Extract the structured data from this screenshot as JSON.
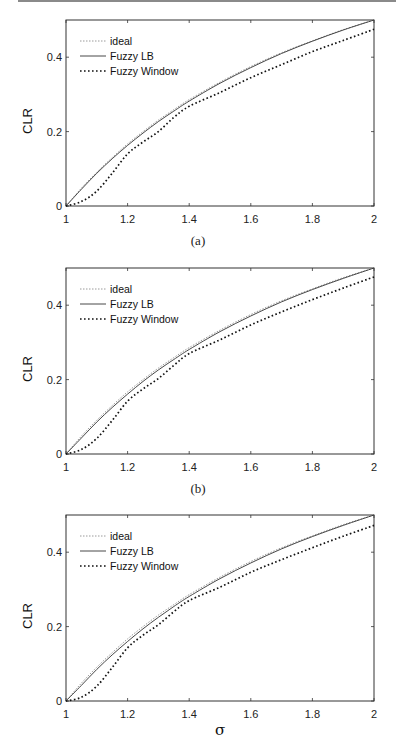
{
  "chart_data": [
    {
      "type": "line",
      "panel": "a",
      "caption": "(a)",
      "title": "",
      "xlabel": "σ",
      "ylabel": "CLR",
      "xlim": [
        1,
        2
      ],
      "ylim": [
        0,
        0.5
      ],
      "xticks": [
        "1",
        "1.2",
        "1.4",
        "1.6",
        "1.8",
        "2"
      ],
      "yticks": [
        "0",
        "0.2",
        "0.4"
      ],
      "grid": false,
      "legend_position": "upper left",
      "x": [
        1.0,
        1.05,
        1.1,
        1.15,
        1.2,
        1.25,
        1.3,
        1.35,
        1.4,
        1.5,
        1.6,
        1.7,
        1.8,
        1.9,
        2.0
      ],
      "series": [
        {
          "name": "ideal",
          "style": "dotted-thin",
          "values": [
            0.0,
            0.048,
            0.091,
            0.13,
            0.167,
            0.2,
            0.231,
            0.259,
            0.286,
            0.333,
            0.375,
            0.412,
            0.444,
            0.474,
            0.5
          ]
        },
        {
          "name": "Fuzzy LB",
          "style": "solid",
          "values": [
            0.0,
            0.045,
            0.088,
            0.127,
            0.163,
            0.196,
            0.227,
            0.255,
            0.282,
            0.33,
            0.372,
            0.41,
            0.443,
            0.473,
            0.5
          ]
        },
        {
          "name": "Fuzzy Window",
          "style": "dotted-thick",
          "values": [
            0.0,
            0.012,
            0.04,
            0.088,
            0.14,
            0.172,
            0.2,
            0.238,
            0.268,
            0.305,
            0.345,
            0.38,
            0.415,
            0.445,
            0.475
          ]
        }
      ]
    },
    {
      "type": "line",
      "panel": "b",
      "caption": "(b)",
      "title": "",
      "xlabel": "σ",
      "ylabel": "CLR",
      "xlim": [
        1,
        2
      ],
      "ylim": [
        0,
        0.5
      ],
      "xticks": [
        "1",
        "1.2",
        "1.4",
        "1.6",
        "1.8",
        "2"
      ],
      "yticks": [
        "0",
        "0.2",
        "0.4"
      ],
      "grid": false,
      "legend_position": "upper left",
      "x": [
        1.0,
        1.05,
        1.1,
        1.15,
        1.2,
        1.25,
        1.3,
        1.35,
        1.4,
        1.5,
        1.6,
        1.7,
        1.8,
        1.9,
        2.0
      ],
      "series": [
        {
          "name": "ideal",
          "style": "dotted-thin",
          "values": [
            0.0,
            0.048,
            0.091,
            0.13,
            0.167,
            0.2,
            0.231,
            0.259,
            0.286,
            0.333,
            0.375,
            0.412,
            0.444,
            0.474,
            0.5
          ]
        },
        {
          "name": "Fuzzy LB",
          "style": "solid",
          "values": [
            0.0,
            0.043,
            0.086,
            0.125,
            0.161,
            0.195,
            0.226,
            0.254,
            0.281,
            0.329,
            0.371,
            0.409,
            0.442,
            0.472,
            0.5
          ]
        },
        {
          "name": "Fuzzy Window",
          "style": "dotted-thick",
          "values": [
            0.0,
            0.012,
            0.042,
            0.09,
            0.142,
            0.175,
            0.203,
            0.238,
            0.27,
            0.307,
            0.347,
            0.382,
            0.415,
            0.446,
            0.476
          ]
        }
      ]
    },
    {
      "type": "line",
      "panel": "c",
      "caption": "",
      "title": "",
      "xlabel": "σ",
      "ylabel": "CLR",
      "xlim": [
        1,
        2
      ],
      "ylim": [
        0,
        0.5
      ],
      "xticks": [
        "1",
        "1.2",
        "1.4",
        "1.6",
        "1.8",
        "2"
      ],
      "yticks": [
        "0",
        "0.2",
        "0.4"
      ],
      "grid": false,
      "legend_position": "upper left",
      "x": [
        1.0,
        1.05,
        1.1,
        1.15,
        1.2,
        1.25,
        1.3,
        1.35,
        1.4,
        1.5,
        1.6,
        1.7,
        1.8,
        1.9,
        2.0
      ],
      "series": [
        {
          "name": "ideal",
          "style": "dotted-thin",
          "values": [
            0.0,
            0.048,
            0.091,
            0.13,
            0.167,
            0.2,
            0.231,
            0.259,
            0.286,
            0.333,
            0.375,
            0.412,
            0.444,
            0.474,
            0.5
          ]
        },
        {
          "name": "Fuzzy LB",
          "style": "solid",
          "values": [
            0.0,
            0.042,
            0.085,
            0.124,
            0.16,
            0.194,
            0.225,
            0.254,
            0.281,
            0.329,
            0.371,
            0.409,
            0.442,
            0.472,
            0.5
          ]
        },
        {
          "name": "Fuzzy Window",
          "style": "dotted-thick",
          "values": [
            0.0,
            0.01,
            0.04,
            0.09,
            0.143,
            0.177,
            0.205,
            0.24,
            0.27,
            0.306,
            0.346,
            0.38,
            0.412,
            0.443,
            0.472
          ]
        }
      ]
    }
  ],
  "figure": {
    "panels": [
      {
        "caption": "(a)",
        "legend": [
          "ideal",
          "Fuzzy LB",
          "Fuzzy Window"
        ],
        "xlabel": "σ",
        "ylabel": "CLR"
      },
      {
        "caption": "(b)",
        "legend": [
          "ideal",
          "Fuzzy LB",
          "Fuzzy Window"
        ],
        "xlabel": "σ",
        "ylabel": "CLR"
      },
      {
        "caption": "",
        "legend": [
          "ideal",
          "Fuzzy LB",
          "Fuzzy Window"
        ],
        "xlabel": "σ",
        "ylabel": "CLR"
      }
    ]
  },
  "colors": {
    "axis": "#333333",
    "ideal": "#9a9a9a",
    "fuzzy_lb": "#333333",
    "fuzzy_window": "#111111"
  }
}
